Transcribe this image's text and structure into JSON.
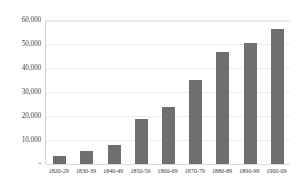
{
  "chart_data": {
    "type": "bar",
    "title": "",
    "subtitle": "",
    "xlabel": "",
    "ylabel": "",
    "categories": [
      "1820-29",
      "1830-39",
      "1840-49",
      "1850-59",
      "1860-69",
      "1870-79",
      "1880-89",
      "1890-99",
      "1900-09"
    ],
    "values": [
      3300,
      5400,
      8000,
      18800,
      23800,
      35000,
      46700,
      50400,
      56300
    ],
    "series": [
      {
        "name": "",
        "values": [
          3300,
          5400,
          8000,
          18800,
          23800,
          35000,
          46700,
          50400,
          56300
        ]
      }
    ],
    "ylim": [
      0,
      60000
    ],
    "ytick_values": [
      0,
      10000,
      20000,
      30000,
      40000,
      50000,
      60000
    ],
    "ytick_labels": [
      "-",
      "10,000",
      "20,000",
      "30,000",
      "40,000",
      "50,000",
      "60,000"
    ],
    "grid": true,
    "grid_axis": "y",
    "legend": false,
    "legend_position": "none",
    "bar_color": "#706f6f",
    "gridline_color": "#ededed",
    "axis_color": "#d3d3d3",
    "text_color": "#3f3f3f",
    "background_color": "#ffffff"
  }
}
